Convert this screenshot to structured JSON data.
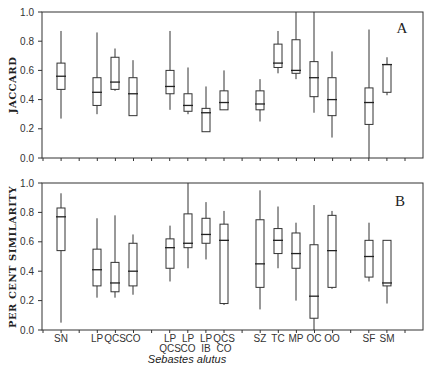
{
  "chart_data": [
    {
      "type": "box",
      "panel": "A",
      "title": "",
      "panel_label": "A",
      "xlabel": "Sebastes alutus",
      "ylabel": "JACCARD",
      "ylim": [
        0.0,
        1.0
      ],
      "yticks": [
        "0.0",
        "0.2",
        "0.4",
        "0.6",
        "0.8",
        "1.0"
      ],
      "grid": false,
      "categories": [
        "SN",
        "LP",
        "QCS",
        "CO",
        "LP QCS",
        "LP CO",
        "LP IB",
        "QCS CO",
        "SZ",
        "TC",
        "MP",
        "OC",
        "OO",
        "SF",
        "SM"
      ],
      "series": [
        {
          "name": "JACCARD",
          "min": [
            0.27,
            0.3,
            0.46,
            0.29,
            0.33,
            0.3,
            0.18,
            0.33,
            0.25,
            0.58,
            0.54,
            0.31,
            0.14,
            0.0,
            0.43
          ],
          "q1": [
            0.47,
            0.36,
            0.47,
            0.29,
            0.44,
            0.32,
            0.18,
            0.33,
            0.33,
            0.62,
            0.58,
            0.42,
            0.29,
            0.23,
            0.45
          ],
          "median": [
            0.56,
            0.45,
            0.52,
            0.44,
            0.49,
            0.36,
            0.31,
            0.38,
            0.37,
            0.65,
            0.6,
            0.55,
            0.4,
            0.38,
            0.64
          ],
          "q3": [
            0.65,
            0.55,
            0.69,
            0.55,
            0.6,
            0.44,
            0.34,
            0.46,
            0.46,
            0.78,
            0.81,
            0.66,
            0.55,
            0.48,
            0.64
          ],
          "max": [
            0.87,
            0.86,
            0.75,
            0.67,
            0.87,
            0.62,
            0.49,
            0.6,
            0.54,
            0.87,
            1.0,
            1.0,
            0.73,
            0.88,
            0.69
          ]
        }
      ]
    },
    {
      "type": "box",
      "panel": "B",
      "title": "",
      "panel_label": "B",
      "xlabel": "Sebastes alutus",
      "ylabel": "PER CENT SIMILARITY",
      "ylim": [
        0.0,
        1.0
      ],
      "yticks": [
        "0.0",
        "0.2",
        "0.4",
        "0.6",
        "0.8",
        "1.0"
      ],
      "grid": false,
      "categories": [
        "SN",
        "LP",
        "QCS",
        "CO",
        "LP QCS",
        "LP CO",
        "LP IB",
        "QCS CO",
        "SZ",
        "TC",
        "MP",
        "OC",
        "OO",
        "SF",
        "SM"
      ],
      "series": [
        {
          "name": "PER CENT SIMILARITY",
          "min": [
            0.05,
            0.22,
            0.22,
            0.24,
            0.33,
            0.42,
            0.48,
            0.17,
            0.14,
            0.42,
            0.2,
            0.0,
            0.28,
            0.33,
            0.18
          ],
          "q1": [
            0.54,
            0.3,
            0.26,
            0.3,
            0.42,
            0.56,
            0.59,
            0.18,
            0.29,
            0.52,
            0.42,
            0.08,
            0.29,
            0.36,
            0.3
          ],
          "median": [
            0.77,
            0.41,
            0.32,
            0.4,
            0.56,
            0.59,
            0.65,
            0.61,
            0.45,
            0.61,
            0.52,
            0.23,
            0.54,
            0.5,
            0.32
          ],
          "q3": [
            0.83,
            0.55,
            0.46,
            0.59,
            0.62,
            0.79,
            0.76,
            0.72,
            0.75,
            0.69,
            0.66,
            0.58,
            0.78,
            0.61,
            0.61
          ],
          "max": [
            0.93,
            0.76,
            0.78,
            0.65,
            0.71,
            1.0,
            0.87,
            0.81,
            0.95,
            0.84,
            0.73,
            0.85,
            0.81,
            0.73,
            0.61
          ]
        }
      ]
    }
  ],
  "panels": {
    "a": {
      "letter": "A",
      "ylabel": "JACCARD"
    },
    "b": {
      "letter": "B",
      "ylabel": "PER CENT SIMILARITY"
    }
  },
  "yticks": [
    "0.0",
    "0.2",
    "0.4",
    "0.6",
    "0.8",
    "1.0"
  ],
  "xaxis": {
    "title": "Sebastes alutus",
    "labels": [
      {
        "line1": "SN",
        "line2": ""
      },
      {
        "line1": "LP",
        "line2": ""
      },
      {
        "line1": "QCS",
        "line2": ""
      },
      {
        "line1": "CO",
        "line2": ""
      },
      {
        "line1": "LP",
        "line2": "QCS"
      },
      {
        "line1": "LP",
        "line2": "CO"
      },
      {
        "line1": "LP",
        "line2": "IB"
      },
      {
        "line1": "QCS",
        "line2": "CO"
      },
      {
        "line1": "SZ",
        "line2": ""
      },
      {
        "line1": "TC",
        "line2": ""
      },
      {
        "line1": "MP",
        "line2": ""
      },
      {
        "line1": "OC",
        "line2": ""
      },
      {
        "line1": "OO",
        "line2": ""
      },
      {
        "line1": "SF",
        "line2": ""
      },
      {
        "line1": "SM",
        "line2": ""
      }
    ]
  }
}
